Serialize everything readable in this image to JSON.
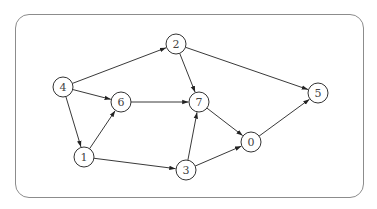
{
  "diagram": {
    "type": "directed-graph",
    "frame": {
      "x": 15,
      "y": 14,
      "width": 349,
      "height": 184,
      "radius": 14,
      "stroke": "#8c8c8c"
    },
    "node_radius": 10,
    "nodes": [
      {
        "id": "0",
        "label": "0",
        "x": 251,
        "y": 142
      },
      {
        "id": "1",
        "label": "1",
        "x": 84,
        "y": 157
      },
      {
        "id": "2",
        "label": "2",
        "x": 176,
        "y": 44
      },
      {
        "id": "3",
        "label": "3",
        "x": 186,
        "y": 170
      },
      {
        "id": "4",
        "label": "4",
        "x": 63,
        "y": 87
      },
      {
        "id": "5",
        "label": "5",
        "x": 318,
        "y": 93
      },
      {
        "id": "6",
        "label": "6",
        "x": 121,
        "y": 102
      },
      {
        "id": "7",
        "label": "7",
        "x": 199,
        "y": 102
      }
    ],
    "edges": [
      {
        "from": "4",
        "to": "2"
      },
      {
        "from": "4",
        "to": "6"
      },
      {
        "from": "4",
        "to": "1"
      },
      {
        "from": "1",
        "to": "6"
      },
      {
        "from": "1",
        "to": "3"
      },
      {
        "from": "6",
        "to": "7"
      },
      {
        "from": "2",
        "to": "7"
      },
      {
        "from": "2",
        "to": "5"
      },
      {
        "from": "3",
        "to": "7"
      },
      {
        "from": "3",
        "to": "0"
      },
      {
        "from": "7",
        "to": "0"
      },
      {
        "from": "0",
        "to": "5"
      }
    ]
  }
}
